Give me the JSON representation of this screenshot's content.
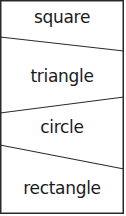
{
  "diagram": {
    "labels": [
      "square",
      "triangle",
      "circle",
      "rectangle"
    ],
    "colors": {
      "line": "#2a2a2a",
      "text": "#1a1a1a",
      "background": "#ffffff"
    }
  }
}
